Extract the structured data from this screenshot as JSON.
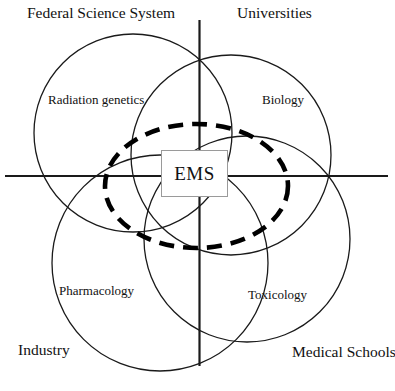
{
  "diagram": {
    "center_box": {
      "label": "EMS"
    },
    "corner_labels": {
      "top_left": "Federal Science System",
      "top_right": "Universities",
      "bottom_left": "Industry",
      "bottom_right": "Medical Schools"
    },
    "circle_labels": {
      "top_left": "Radiation genetics",
      "top_right": "Biology",
      "bottom_left": "Pharmacology",
      "bottom_right": "Toxicology"
    },
    "colors": {
      "stroke": "#1a1a1a",
      "dashed_stroke": "#000000",
      "box_border": "#9a9a9a",
      "background": "#ffffff"
    }
  }
}
